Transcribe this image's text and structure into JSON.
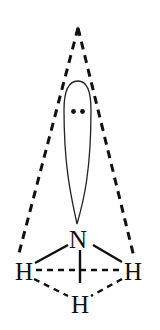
{
  "diagram": {
    "title": "",
    "type": "molecular-geometry",
    "colors": {
      "ink": "#111111",
      "background": "#ffffff"
    },
    "atoms": {
      "central": {
        "label": "N"
      },
      "left": {
        "label": "H"
      },
      "right": {
        "label": "H"
      },
      "bottom": {
        "label": "H"
      }
    },
    "lone_pair": {
      "symbol": "••"
    }
  }
}
